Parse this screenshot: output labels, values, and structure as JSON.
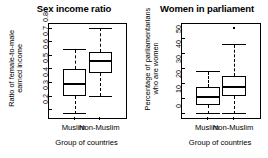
{
  "figure": {
    "background": "#ffffff",
    "foreground": "#000000"
  },
  "panels": [
    {
      "id": "sex-income-ratio",
      "title": "Sex income ratio",
      "ylabel_line1": "Ratio of female-to-male",
      "ylabel_line2": "earned income",
      "xlabel": "Group of countries",
      "ytick_labels": [
        "0.2",
        "0.3",
        "0.4",
        "0.5",
        "0.6",
        "0.7",
        "0.8"
      ],
      "xtick_labels": [
        "Muslim",
        "Non-Muslim"
      ]
    },
    {
      "id": "women-in-parliament",
      "title": "Women in parliament",
      "ylabel_line1": "Percentage of parliamentarians",
      "ylabel_line2": "who are women",
      "xlabel": "Group of countries",
      "ytick_labels": [
        "0",
        "10",
        "20",
        "30",
        "40",
        "50"
      ],
      "xtick_labels": [
        "Muslim",
        "Non-Muslim"
      ]
    }
  ],
  "chart_data": [
    {
      "type": "box",
      "id": "sex-income-ratio",
      "title": "Sex income ratio",
      "xlabel": "Group of countries",
      "ylabel": "Ratio of female-to-male earned income",
      "categories": [
        "Muslim",
        "Non-Muslim"
      ],
      "yticks": [
        0.2,
        0.3,
        0.4,
        0.5,
        0.6,
        0.7,
        0.8
      ],
      "ylim": [
        0.14,
        0.83
      ],
      "grid": false,
      "legend": "none",
      "boxes": [
        {
          "name": "Muslim",
          "whisker_low": 0.17,
          "q1": 0.3,
          "median": 0.39,
          "q3": 0.5,
          "whisker_high": 0.64,
          "outliers": []
        },
        {
          "name": "Non-Muslim",
          "whisker_low": 0.3,
          "q1": 0.47,
          "median": 0.555,
          "q3": 0.625,
          "whisker_high": 0.8,
          "outliers": []
        }
      ]
    },
    {
      "type": "box",
      "id": "women-in-parliament",
      "title": "Women in parliament",
      "xlabel": "Group of countries",
      "ylabel": "Percentage of parliamentarians who are women",
      "categories": [
        "Muslim",
        "Non-Muslim"
      ],
      "yticks": [
        0,
        10,
        20,
        30,
        40,
        50
      ],
      "ylim": [
        -3,
        60
      ],
      "grid": false,
      "legend": "none",
      "boxes": [
        {
          "name": "Muslim",
          "whisker_low": 0.0,
          "q1": 5.5,
          "median": 11.0,
          "q3": 17.5,
          "whisker_high": 28.0,
          "outliers": []
        },
        {
          "name": "Non-Muslim",
          "whisker_low": 0.0,
          "q1": 12.0,
          "median": 17.5,
          "q3": 25.0,
          "whisker_high": 46.0,
          "outliers": [
            57.0
          ]
        }
      ]
    }
  ]
}
